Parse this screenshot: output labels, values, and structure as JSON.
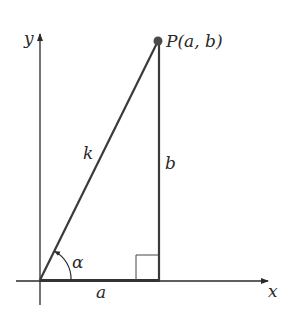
{
  "labels": {
    "y_axis": "y",
    "x_axis": "x",
    "point": "P(a, b)",
    "hypotenuse": "k",
    "vertical_side": "b",
    "horizontal_side": "a",
    "angle": "α"
  },
  "colors": {
    "stroke": "#3a3a3a",
    "point": "#4a4a4a",
    "text": "#2a2a2a"
  }
}
